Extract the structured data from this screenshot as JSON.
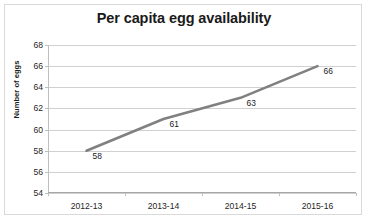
{
  "chart_data": {
    "type": "line",
    "title": "Per capita egg availability",
    "xlabel": "",
    "ylabel": "Number of eggs",
    "categories": [
      "2012-13",
      "2013-14",
      "2014-15",
      "2015-16"
    ],
    "values": [
      58,
      61,
      63,
      66
    ],
    "data_labels": [
      "58",
      "61",
      "63",
      "66"
    ],
    "ylim": [
      54,
      68
    ],
    "ytick_step": 2,
    "yticks": [
      54,
      56,
      58,
      60,
      62,
      64,
      66,
      68
    ],
    "ytick_labels": [
      "54",
      "56",
      "58",
      "60",
      "62",
      "64",
      "66",
      "68"
    ],
    "grid": true,
    "grid_axis": "y",
    "legend": false,
    "series": [
      {
        "name": "Per capita egg availability",
        "values": [
          58,
          61,
          63,
          66
        ],
        "color": "#808080",
        "line_width": 2.6,
        "markers": false
      }
    ],
    "colors": {
      "line": "#808080",
      "gridline": "#d0d0d0",
      "axis": "#bfbfbf",
      "text": "#1a1a1a",
      "background": "#ffffff",
      "frame_border": "#d9d9d9"
    }
  }
}
